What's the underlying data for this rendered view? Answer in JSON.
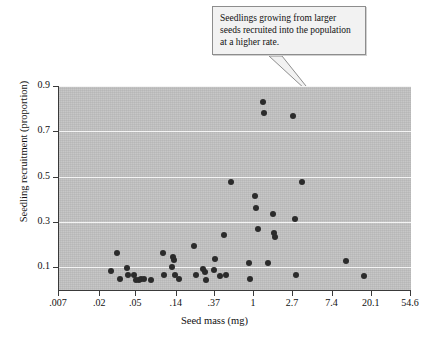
{
  "annotation": {
    "text": "Seedlings growing from larger seeds recruited into the population at a higher rate."
  },
  "chart_data": {
    "type": "scatter",
    "title": "",
    "xlabel": "Seed mass (mg)",
    "ylabel": "Seedling recruitment (proportion)",
    "x_scale": "log",
    "x_ticklabels": [
      ".007",
      ".02",
      ".05",
      ".14",
      ".37",
      "1",
      "2.7",
      "7.4",
      "20.1",
      "54.6"
    ],
    "x_tickvalues": [
      0.007,
      0.02,
      0.05,
      0.14,
      0.37,
      1,
      2.7,
      7.4,
      20.1,
      54.6
    ],
    "y_ticklabels": [
      "0.9",
      "0.7",
      "0.5",
      "0.3",
      "0.1"
    ],
    "y_tickvalues": [
      0.9,
      0.7,
      0.5,
      0.3,
      0.1
    ],
    "ylim": [
      0.0,
      0.9
    ],
    "xlim": [
      0.007,
      54.6
    ],
    "grid": "horizontal",
    "legend": "none",
    "panel_color": "#c2c2c2",
    "gridline_color": "#f4f4f4",
    "marker_color": "#2b2b2b",
    "points": [
      {
        "x": 0.026,
        "y": 0.083
      },
      {
        "x": 0.031,
        "y": 0.165
      },
      {
        "x": 0.033,
        "y": 0.047
      },
      {
        "x": 0.04,
        "y": 0.097
      },
      {
        "x": 0.041,
        "y": 0.067
      },
      {
        "x": 0.047,
        "y": 0.066
      },
      {
        "x": 0.05,
        "y": 0.043
      },
      {
        "x": 0.053,
        "y": 0.043
      },
      {
        "x": 0.057,
        "y": 0.048
      },
      {
        "x": 0.061,
        "y": 0.05
      },
      {
        "x": 0.072,
        "y": 0.045
      },
      {
        "x": 0.1,
        "y": 0.163
      },
      {
        "x": 0.102,
        "y": 0.068
      },
      {
        "x": 0.125,
        "y": 0.102
      },
      {
        "x": 0.128,
        "y": 0.146
      },
      {
        "x": 0.13,
        "y": 0.131
      },
      {
        "x": 0.133,
        "y": 0.067
      },
      {
        "x": 0.15,
        "y": 0.048
      },
      {
        "x": 0.22,
        "y": 0.196
      },
      {
        "x": 0.228,
        "y": 0.067
      },
      {
        "x": 0.275,
        "y": 0.091
      },
      {
        "x": 0.285,
        "y": 0.079
      },
      {
        "x": 0.295,
        "y": 0.046
      },
      {
        "x": 0.36,
        "y": 0.09
      },
      {
        "x": 0.37,
        "y": 0.138
      },
      {
        "x": 0.42,
        "y": 0.063
      },
      {
        "x": 0.47,
        "y": 0.243
      },
      {
        "x": 0.49,
        "y": 0.064
      },
      {
        "x": 0.56,
        "y": 0.477
      },
      {
        "x": 0.88,
        "y": 0.121
      },
      {
        "x": 0.9,
        "y": 0.048
      },
      {
        "x": 1.02,
        "y": 0.416
      },
      {
        "x": 1.06,
        "y": 0.36
      },
      {
        "x": 1.1,
        "y": 0.268
      },
      {
        "x": 1.25,
        "y": 0.829
      },
      {
        "x": 1.28,
        "y": 0.779
      },
      {
        "x": 1.45,
        "y": 0.121
      },
      {
        "x": 1.62,
        "y": 0.336
      },
      {
        "x": 1.68,
        "y": 0.25
      },
      {
        "x": 1.72,
        "y": 0.233
      },
      {
        "x": 2.7,
        "y": 0.768
      },
      {
        "x": 2.85,
        "y": 0.315
      },
      {
        "x": 2.9,
        "y": 0.066
      },
      {
        "x": 3.4,
        "y": 0.478
      },
      {
        "x": 10.5,
        "y": 0.128
      },
      {
        "x": 16.5,
        "y": 0.06
      }
    ]
  }
}
